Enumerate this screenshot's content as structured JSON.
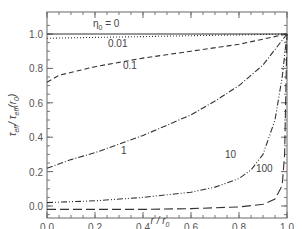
{
  "chart_data": {
    "type": "line",
    "title": "",
    "xlabel": "r/r0",
    "ylabel": "τ_eff / τ_eff(r0)",
    "xlim": [
      0.0,
      1.0
    ],
    "ylim": [
      -0.03,
      1.12
    ],
    "x_ticks": [
      "0.0",
      "0.2",
      "0.4",
      "0.6",
      "0.8",
      "1.0"
    ],
    "y_ticks": [
      "0.0",
      "0.2",
      "0.4",
      "0.6",
      "0.8",
      "1.0"
    ],
    "grid": false,
    "legend": "inline curve labels",
    "label_prefix": "η0 =",
    "series": [
      {
        "name": "0",
        "label": "η0 = 0",
        "style": "solid",
        "x": [
          0.0,
          0.2,
          0.4,
          0.6,
          0.8,
          1.0
        ],
        "y": [
          1.0,
          1.0,
          1.0,
          1.0,
          1.0,
          1.0
        ]
      },
      {
        "name": "0.01",
        "label": "0.01",
        "style": "dotted",
        "x": [
          0.0,
          0.2,
          0.4,
          0.6,
          0.8,
          1.0
        ],
        "y": [
          0.975,
          0.98,
          0.985,
          0.99,
          0.995,
          1.0
        ]
      },
      {
        "name": "0.1",
        "label": "0.1",
        "style": "dashed",
        "x": [
          0.0,
          0.05,
          0.2,
          0.4,
          0.6,
          0.8,
          1.0
        ],
        "y": [
          0.72,
          0.76,
          0.81,
          0.86,
          0.9,
          0.94,
          1.0
        ]
      },
      {
        "name": "1",
        "label": "1",
        "style": "dash-dot",
        "x": [
          0.0,
          0.1,
          0.2,
          0.3,
          0.4,
          0.5,
          0.6,
          0.7,
          0.8,
          0.9,
          1.0
        ],
        "y": [
          0.22,
          0.27,
          0.31,
          0.36,
          0.41,
          0.47,
          0.53,
          0.61,
          0.7,
          0.82,
          1.0
        ]
      },
      {
        "name": "10",
        "label": "10",
        "style": "dash-dot-dot",
        "x": [
          0.0,
          0.2,
          0.4,
          0.6,
          0.7,
          0.8,
          0.85,
          0.9,
          0.95,
          0.98,
          1.0
        ],
        "y": [
          0.02,
          0.03,
          0.05,
          0.08,
          0.11,
          0.16,
          0.21,
          0.3,
          0.5,
          0.75,
          1.0
        ]
      },
      {
        "name": "100",
        "label": "100",
        "style": "long-dash",
        "x": [
          0.0,
          0.2,
          0.4,
          0.6,
          0.8,
          0.9,
          0.95,
          0.98,
          0.99,
          1.0
        ],
        "y": [
          -0.02,
          -0.02,
          -0.02,
          -0.015,
          -0.005,
          0.01,
          0.04,
          0.12,
          0.3,
          1.0
        ]
      }
    ]
  },
  "labels": {
    "eta_prefix": "η",
    "eta_sub": "0",
    "eta_eq": "= 0",
    "c001": "0.01",
    "c01": "0.1",
    "c1": "1",
    "c10": "10",
    "c100": "100",
    "xlabel_main": "r / r",
    "xlabel_sub": "0",
    "ylabel_text": "τ",
    "ylabel_sub1": "eff",
    "ylabel_mid": "/ τ",
    "ylabel_sub2": "eff",
    "ylabel_tail": "(r",
    "ylabel_sub3": "0",
    "ylabel_close": ")"
  }
}
